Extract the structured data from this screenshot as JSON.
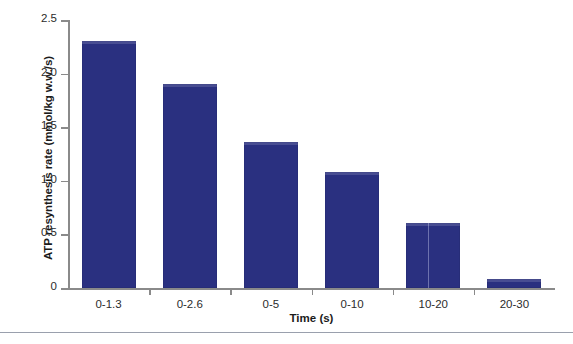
{
  "chart_data": {
    "type": "bar",
    "title": "",
    "xlabel": "Time (s)",
    "ylabel": "ATP resynthesis rate (mmol/kg w.w./s)",
    "categories": [
      "0-1.3",
      "0-2.6",
      "0-5",
      "0-10",
      "10-20",
      "20-30"
    ],
    "values": [
      2.3,
      1.9,
      1.36,
      1.08,
      0.61,
      0.08
    ],
    "ylim": [
      0,
      2.5
    ],
    "ytick_labels": [
      "2.5",
      "2.0",
      "1.5",
      "1.0",
      "0.5",
      "0"
    ],
    "ytick_values": [
      2.5,
      2.0,
      1.5,
      1.0,
      0.5,
      0
    ],
    "grid": false,
    "legend": null,
    "bar_color": "#2a3080",
    "axis_color": "#8a8a8a"
  },
  "footer": {
    "clipped_caption": ""
  }
}
